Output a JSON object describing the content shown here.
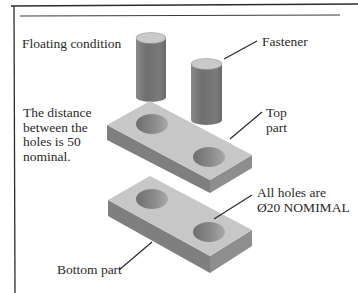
{
  "labels": {
    "floating_condition": "Floating condition",
    "fastener": "Fastener",
    "top_part_line1": "Top",
    "top_part_line2": "part",
    "distance_note": [
      "The distance",
      "between the",
      "holes is 50",
      "nominal."
    ],
    "holes_note_line1": "All holes are",
    "holes_note_line2": "Ø20 NOMIMAL",
    "bottom_part": "Bottom part"
  },
  "colors": {
    "frame": "#2b2b2b",
    "plate_top": "#c7c7c7",
    "plate_left": "#7f7f7f",
    "plate_right": "#8e8e8e",
    "cylinder_body": "#7c7c7c",
    "cylinder_top": "#c9c9c9",
    "hole": "#8a8a8a",
    "leader": "#2a2a2a"
  }
}
